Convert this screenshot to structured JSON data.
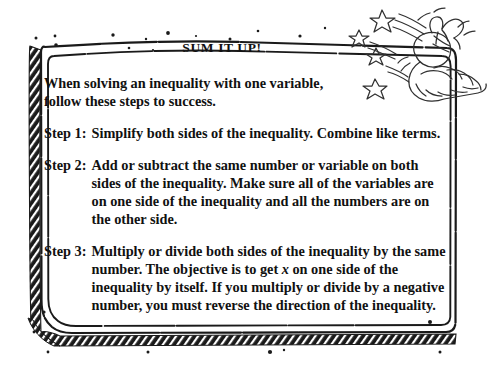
{
  "poster": {
    "title": "SUM IT UP!",
    "intro": "When solving an inequality with one variable, follow these steps to success.",
    "steps": [
      {
        "label": "Step 1:",
        "text_before_x": "Simplify both sides of the inequality. Combine like terms.",
        "text_after_x": ""
      },
      {
        "label": "Step 2:",
        "text_before_x": "Add or subtract the same number or variable on both sides of the inequality. Make sure all of the variables are on one side of the inequality and all the numbers are on the other side.",
        "text_after_x": ""
      },
      {
        "label": "Step 3:",
        "text_before_x": "Multiply or divide both sides of the inequality by the same number. The objective is to get ",
        "italic_var": "x",
        "text_after_x": " on one side of the inequality by itself. If you multiply or divide by a negative number, you must reverse the direction of the inequality."
      }
    ]
  },
  "illustration": {
    "name": "hand-holding-sack-with-stars",
    "description": "hand drawn sketch of a hand holding a tied sack with a bow, stars shooting out"
  },
  "colors": {
    "ink": "#1a1a1a",
    "paper": "#ffffff"
  }
}
